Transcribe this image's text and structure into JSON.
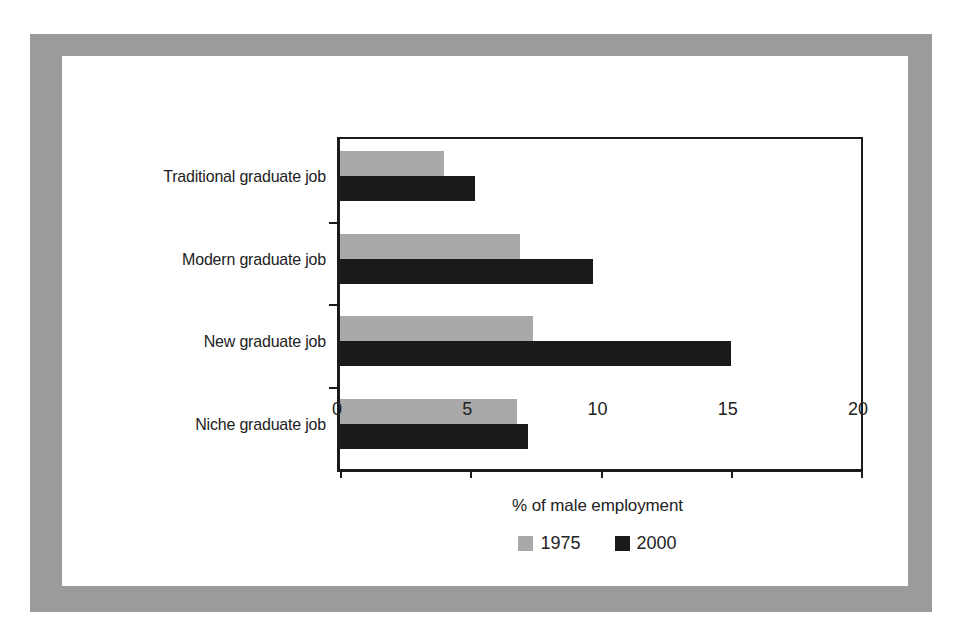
{
  "chart_data": {
    "type": "bar",
    "orientation": "horizontal",
    "title": "",
    "xlabel": "% of male employment",
    "ylabel": "",
    "xlim": [
      0,
      20
    ],
    "xticks": [
      "0",
      "5",
      "10",
      "15",
      "20"
    ],
    "xtick_values": [
      0,
      5,
      10,
      15,
      20
    ],
    "grid": false,
    "legend_position": "bottom-center",
    "categories": [
      "Traditional graduate job",
      "Modern graduate job",
      "New graduate job",
      "Niche graduate job"
    ],
    "series": [
      {
        "name": "1975",
        "color": "#a9a9a9",
        "values": [
          4.0,
          6.9,
          7.4,
          6.8
        ]
      },
      {
        "name": "2000",
        "color": "#1a1a1a",
        "values": [
          5.2,
          9.7,
          15.0,
          7.2
        ]
      }
    ]
  },
  "figure": {
    "frame_color": "#9b9b9b",
    "canvas_color": "#ffffff",
    "axis_color": "#1b1b1b"
  },
  "legend": {
    "entries": [
      {
        "label": "1975",
        "swatch": "legend-swatch-1975"
      },
      {
        "label": "2000",
        "swatch": "legend-swatch-2000"
      }
    ]
  }
}
